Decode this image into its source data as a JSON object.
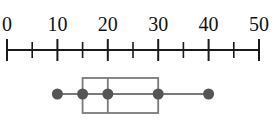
{
  "chart_data": {
    "type": "box",
    "title": "",
    "xlabel": "",
    "ylabel": "",
    "xlim": [
      0,
      50
    ],
    "major_ticks": [
      0,
      10,
      20,
      30,
      40,
      50
    ],
    "minor_ticks": [
      5,
      15,
      25,
      35,
      45
    ],
    "tick_labels": [
      "0",
      "10",
      "20",
      "30",
      "40",
      "50"
    ],
    "five_number_summary": {
      "min": 10,
      "q1": 15,
      "median": 20,
      "q3": 30,
      "max": 40
    },
    "grid": false,
    "legend": null
  },
  "colors": {
    "axis": "#1a1a1a",
    "box": "#7a7a7a",
    "dots": "#555555"
  }
}
